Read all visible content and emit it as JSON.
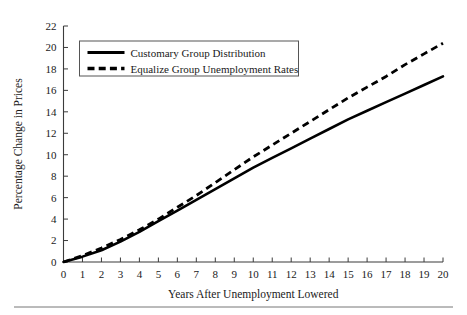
{
  "chart_data": {
    "type": "line",
    "title": "",
    "xlabel": "Years After Unemployment Lowered",
    "ylabel": "Percentage Change in Prices",
    "xlim": [
      0,
      20
    ],
    "ylim": [
      0,
      22
    ],
    "xticks": [
      0,
      1,
      2,
      3,
      4,
      5,
      6,
      7,
      8,
      9,
      10,
      11,
      12,
      13,
      14,
      15,
      16,
      17,
      18,
      19,
      20
    ],
    "yticks": [
      0,
      2,
      4,
      6,
      8,
      10,
      12,
      14,
      16,
      18,
      20,
      22
    ],
    "grid": false,
    "legend_position": "upper-left-inside",
    "x": [
      0,
      1,
      2,
      3,
      4,
      5,
      6,
      7,
      8,
      9,
      10,
      11,
      12,
      13,
      14,
      15,
      16,
      17,
      18,
      19,
      20
    ],
    "series": [
      {
        "name": "Customary Group Distribution",
        "style": "solid",
        "color": "#000000",
        "values": [
          0.0,
          0.5,
          1.1,
          1.9,
          2.8,
          3.8,
          4.8,
          5.8,
          6.8,
          7.8,
          8.8,
          9.7,
          10.6,
          11.5,
          12.4,
          13.3,
          14.1,
          14.9,
          15.7,
          16.5,
          17.3
        ]
      },
      {
        "name": "Equalize Group Unemployment Rates",
        "style": "dashed",
        "color": "#000000",
        "values": [
          0.0,
          0.6,
          1.3,
          2.1,
          3.0,
          4.0,
          5.1,
          6.2,
          7.4,
          8.6,
          9.8,
          10.9,
          12.0,
          13.1,
          14.2,
          15.3,
          16.3,
          17.3,
          18.4,
          19.4,
          20.4
        ]
      }
    ]
  },
  "axis": {
    "y_title": "Percentage Change in Prices",
    "x_title": "Years After Unemployment Lowered",
    "y_tick_labels": [
      "0",
      "2",
      "4",
      "6",
      "8",
      "10",
      "12",
      "14",
      "16",
      "18",
      "20",
      "22"
    ],
    "x_tick_labels": [
      "0",
      "1",
      "2",
      "3",
      "4",
      "5",
      "6",
      "7",
      "8",
      "9",
      "10",
      "11",
      "12",
      "13",
      "14",
      "15",
      "16",
      "17",
      "18",
      "19",
      "20"
    ]
  },
  "legend": {
    "entries": [
      {
        "label": "Customary Group Distribution",
        "style": "solid"
      },
      {
        "label": "Equalize Group Unemployment Rates",
        "style": "dashed"
      }
    ]
  }
}
